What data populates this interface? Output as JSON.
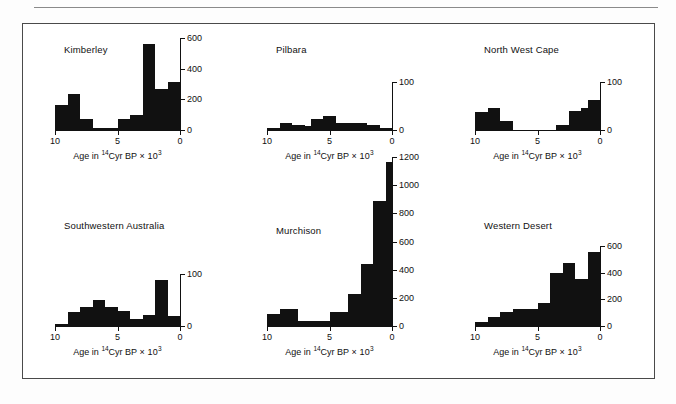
{
  "figure": {
    "background": "#ffffff",
    "bar_color": "#111111",
    "axis_color": "#111111",
    "frame_border_color": "#4a4a4a",
    "xaxis_title_prefix": "Age in ",
    "xaxis_title_isotope": "14",
    "xaxis_title_middle": "Cyr BP",
    "xaxis_title_multiplier": "× 10",
    "xaxis_title_exponent": "3"
  },
  "chart_data": [
    {
      "type": "bar",
      "title": "Kimberley",
      "xlabel": "Age in 14Cyr BP × 10^3",
      "ylabel": "",
      "xlim": [
        10,
        0
      ],
      "ylim": [
        0,
        600
      ],
      "xticks": [
        10,
        5,
        0
      ],
      "xtick_labels": [
        "10",
        "5",
        "0"
      ],
      "yticks": [
        0,
        200,
        400,
        600
      ],
      "ytick_labels": [
        "0",
        "200",
        "400",
        "600"
      ],
      "bin_width": 0.5,
      "grid": false,
      "bins_left": [
        10.0,
        9.5,
        9.0,
        8.5,
        8.0,
        7.5,
        7.0,
        6.5,
        6.0,
        5.5,
        5.0,
        4.5,
        4.0,
        3.5,
        3.0,
        2.5,
        2.0,
        1.5,
        1.0,
        0.5
      ],
      "values": [
        160,
        160,
        235,
        235,
        70,
        70,
        15,
        15,
        15,
        15,
        70,
        70,
        95,
        95,
        560,
        560,
        265,
        265,
        310,
        310
      ]
    },
    {
      "type": "bar",
      "title": "Pilbara",
      "xlabel": "Age in 14Cyr BP × 10^3",
      "ylabel": "",
      "xlim": [
        10,
        0
      ],
      "ylim": [
        0,
        100
      ],
      "xticks": [
        10,
        5,
        0
      ],
      "xtick_labels": [
        "10",
        "5",
        "0"
      ],
      "yticks": [
        0,
        100
      ],
      "ytick_labels": [
        "0",
        "100"
      ],
      "bin_width": 0.5,
      "grid": false,
      "bins_left": [
        10.0,
        9.5,
        9.0,
        8.5,
        8.0,
        7.5,
        7.0,
        6.5,
        6.0,
        5.5,
        5.0,
        4.5,
        4.0,
        3.5,
        3.0,
        2.5,
        2.0,
        1.5,
        1.0,
        0.5
      ],
      "values": [
        4,
        4,
        14,
        14,
        10,
        10,
        8,
        22,
        22,
        30,
        30,
        14,
        14,
        14,
        14,
        14,
        10,
        10,
        4,
        4
      ]
    },
    {
      "type": "bar",
      "title": "North West Cape",
      "xlabel": "Age in 14Cyr BP × 10^3",
      "ylabel": "",
      "xlim": [
        10,
        0
      ],
      "ylim": [
        0,
        100
      ],
      "xticks": [
        10,
        5,
        0
      ],
      "xtick_labels": [
        "10",
        "5",
        "0"
      ],
      "yticks": [
        0,
        100
      ],
      "ytick_labels": [
        "0",
        "100"
      ],
      "bin_width": 0.5,
      "grid": false,
      "bins_left": [
        10.0,
        9.5,
        9.0,
        8.5,
        8.0,
        7.5,
        7.0,
        6.5,
        6.0,
        5.5,
        5.0,
        4.5,
        4.0,
        3.5,
        3.0,
        2.5,
        2.0,
        1.5,
        1.0,
        0.5
      ],
      "values": [
        38,
        38,
        46,
        46,
        18,
        18,
        0,
        0,
        0,
        0,
        0,
        0,
        0,
        10,
        10,
        40,
        40,
        46,
        62,
        62
      ]
    },
    {
      "type": "bar",
      "title": "Southwestern Australia",
      "xlabel": "Age in 14Cyr BP × 10^3",
      "ylabel": "",
      "xlim": [
        10,
        0
      ],
      "ylim": [
        0,
        100
      ],
      "xticks": [
        10,
        5,
        0
      ],
      "xtick_labels": [
        "10",
        "5",
        "0"
      ],
      "yticks": [
        0,
        100
      ],
      "ytick_labels": [
        "0",
        "100"
      ],
      "bin_width": 0.5,
      "grid": false,
      "bins_left": [
        10.0,
        9.5,
        9.0,
        8.5,
        8.0,
        7.5,
        7.0,
        6.5,
        6.0,
        5.5,
        5.0,
        4.5,
        4.0,
        3.5,
        3.0,
        2.5,
        2.0,
        1.5,
        1.0,
        0.5
      ],
      "values": [
        4,
        4,
        26,
        26,
        36,
        36,
        50,
        50,
        36,
        36,
        28,
        28,
        14,
        14,
        22,
        22,
        88,
        88,
        20,
        20
      ]
    },
    {
      "type": "bar",
      "title": "Murchison",
      "xlabel": "Age in 14Cyr BP × 10^3",
      "ylabel": "",
      "xlim": [
        10,
        0
      ],
      "ylim": [
        0,
        1200
      ],
      "xticks": [
        10,
        5,
        0
      ],
      "xtick_labels": [
        "10",
        "5",
        "0"
      ],
      "yticks": [
        0,
        200,
        400,
        600,
        800,
        1000,
        1200
      ],
      "ytick_labels": [
        "0",
        "200",
        "400",
        "600",
        "800",
        "1000",
        "1200"
      ],
      "bin_width": 0.5,
      "grid": false,
      "bins_left": [
        10.0,
        9.5,
        9.0,
        8.5,
        8.0,
        7.5,
        7.0,
        6.5,
        6.0,
        5.5,
        5.0,
        4.5,
        4.0,
        3.5,
        3.0,
        2.5,
        2.0,
        1.5,
        1.0,
        0.5
      ],
      "values": [
        85,
        85,
        120,
        120,
        120,
        35,
        35,
        35,
        35,
        35,
        100,
        100,
        100,
        225,
        225,
        440,
        440,
        890,
        890,
        1165
      ]
    },
    {
      "type": "bar",
      "title": "Western Desert",
      "xlabel": "Age in 14Cyr BP × 10^3",
      "ylabel": "",
      "xlim": [
        10,
        0
      ],
      "ylim": [
        0,
        600
      ],
      "xticks": [
        10,
        5,
        0
      ],
      "xtick_labels": [
        "10",
        "5",
        "0"
      ],
      "yticks": [
        0,
        200,
        400,
        600
      ],
      "ytick_labels": [
        "0",
        "200",
        "400",
        "600"
      ],
      "bin_width": 0.5,
      "grid": false,
      "bins_left": [
        10.0,
        9.5,
        9.0,
        8.5,
        8.0,
        7.5,
        7.0,
        6.5,
        6.0,
        5.5,
        5.0,
        4.5,
        4.0,
        3.5,
        3.0,
        2.5,
        2.0,
        1.5,
        1.0,
        0.5
      ],
      "values": [
        30,
        30,
        70,
        70,
        105,
        105,
        125,
        125,
        130,
        130,
        175,
        175,
        400,
        400,
        470,
        470,
        355,
        355,
        555,
        555
      ]
    }
  ],
  "panels": [
    {
      "key": "kimberley",
      "title": "Kimberley"
    },
    {
      "key": "pilbara",
      "title": "Pilbara"
    },
    {
      "key": "north_west_cape",
      "title": "North West Cape"
    },
    {
      "key": "southwestern_australia",
      "title": "Southwestern Australia"
    },
    {
      "key": "murchison",
      "title": "Murchison"
    },
    {
      "key": "western_desert",
      "title": "Western Desert"
    }
  ]
}
